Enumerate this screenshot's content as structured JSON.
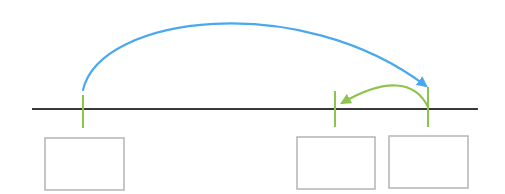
{
  "diagram": {
    "colors": {
      "background": "#ffffff",
      "axis": "#3a3a3a",
      "tick": "#8dc450",
      "blue_arc": "#4aa8ee",
      "green_arc": "#8dc450",
      "box_border": "#b4b4b4"
    },
    "axis": {
      "x1": 32,
      "x2": 478,
      "y": 109,
      "width": 2.2
    },
    "ticks": [
      {
        "id": "tick-left",
        "x": 83,
        "y1": 95,
        "y2": 128
      },
      {
        "id": "tick-middle",
        "x": 335,
        "y1": 91,
        "y2": 127
      },
      {
        "id": "tick-right",
        "x": 428,
        "y1": 87,
        "y2": 127
      }
    ],
    "arcs": [
      {
        "id": "blue-jump",
        "from_tick": "tick-left",
        "to_tick": "tick-right",
        "color": "#4aa8ee",
        "direction": "right",
        "path": "M 83 90 C 100 15, 300 -10, 426 86"
      },
      {
        "id": "green-jump-back",
        "from_tick": "tick-right",
        "to_tick": "tick-middle",
        "color": "#8dc450",
        "direction": "left",
        "path": "M 428 107 C 415 80, 385 78, 342 103"
      }
    ],
    "boxes": [
      {
        "id": "box-left",
        "x": 45,
        "y": 138,
        "w": 79,
        "h": 52,
        "text": ""
      },
      {
        "id": "box-middle",
        "x": 297,
        "y": 137,
        "w": 78,
        "h": 52,
        "text": ""
      },
      {
        "id": "box-right",
        "x": 389,
        "y": 136,
        "w": 79,
        "h": 52,
        "text": ""
      }
    ]
  }
}
